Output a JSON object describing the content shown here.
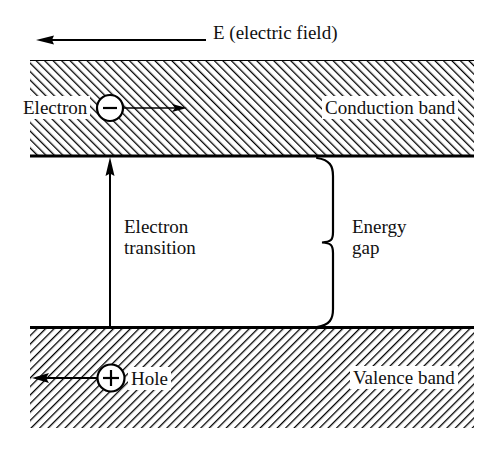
{
  "figure": {
    "width": 484,
    "height": 450,
    "background_color": "#ffffff",
    "ink_color": "#000000"
  },
  "labels": {
    "electric_field": "E (electric field)",
    "electron": "Electron",
    "conduction_band": "Conduction band",
    "electron_transition_line1": "Electron",
    "electron_transition_line2": "transition",
    "energy_gap_line1": "Energy",
    "energy_gap_line2": "gap",
    "hole": "Hole",
    "valence_band": "Valence band",
    "electron_charge_symbol": "−",
    "hole_charge_symbol": "+"
  },
  "bands": {
    "conduction": {
      "name": "Conduction band",
      "x": 30,
      "y": 60,
      "width": 444,
      "height": 97,
      "hatch_direction": "forward-slash",
      "hatch_angle_deg": 45,
      "hatch_spacing": 6,
      "fill": "#ffffff",
      "stroke": "#000000"
    },
    "valence": {
      "name": "Valence band",
      "x": 30,
      "y": 327,
      "width": 444,
      "height": 101,
      "hatch_direction": "back-slash",
      "hatch_angle_deg": -45,
      "hatch_spacing": 6,
      "fill": "#ffffff",
      "stroke": "#000000"
    }
  },
  "annotations": {
    "electric_field_arrow": {
      "name": "electric-field-arrow",
      "direction": "left",
      "x_start": 205,
      "x_end": 38,
      "y": 40
    },
    "electron_particle": {
      "name": "electron",
      "charge": "negative",
      "cx": 110,
      "cy": 108,
      "r": 13,
      "drift_arrow_direction": "right",
      "drift_arrow_x_end": 186
    },
    "hole_particle": {
      "name": "hole",
      "charge": "positive",
      "cx": 111,
      "cy": 378,
      "r": 13,
      "drift_arrow_direction": "left",
      "drift_arrow_x_end": 33
    },
    "transition_arrow": {
      "name": "electron-transition-arrow",
      "direction": "up",
      "x": 110,
      "y_start": 327,
      "y_end": 158
    },
    "energy_gap_brace": {
      "name": "energy-gap-brace",
      "spine_x": 333,
      "tip_x": 321,
      "y_top": 158,
      "y_bottom": 327
    }
  }
}
